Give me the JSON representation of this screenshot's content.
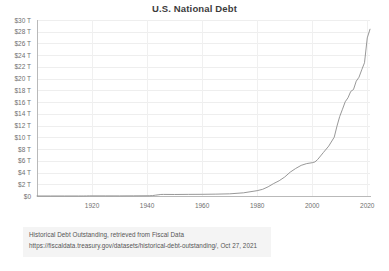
{
  "chart_data": {
    "type": "line",
    "title": "U.S. National Debt",
    "xlabel": "",
    "ylabel": "",
    "xlim": [
      1900,
      2021
    ],
    "ylim": [
      0,
      30
    ],
    "grid": true,
    "legend": "none",
    "y_unit": "trillions of USD",
    "y_tick_labels": [
      "$30 T",
      "$28 T",
      "$26 T",
      "$24 T",
      "$22 T",
      "$20 T",
      "$18 T",
      "$16 T",
      "$14 T",
      "$12 T",
      "$10 T",
      "$8 T",
      "$6 T",
      "$4 T",
      "$2 T",
      "$0"
    ],
    "y_tick_values": [
      30,
      28,
      26,
      24,
      22,
      20,
      18,
      16,
      14,
      12,
      10,
      8,
      6,
      4,
      2,
      0
    ],
    "x_tick_labels": [
      "1920",
      "1940",
      "1960",
      "1980",
      "2000",
      "2020"
    ],
    "x_tick_values": [
      1920,
      1940,
      1960,
      1980,
      2000,
      2020
    ],
    "series": [
      {
        "name": "Total Public Debt Outstanding",
        "color": "#8c8c8c",
        "x": [
          1900,
          1905,
          1910,
          1915,
          1916,
          1917,
          1918,
          1919,
          1920,
          1925,
          1930,
          1935,
          1940,
          1941,
          1942,
          1943,
          1944,
          1945,
          1946,
          1950,
          1955,
          1960,
          1965,
          1970,
          1975,
          1980,
          1982,
          1984,
          1986,
          1988,
          1990,
          1992,
          1994,
          1996,
          1998,
          2000,
          2001,
          2002,
          2004,
          2006,
          2008,
          2009,
          2010,
          2011,
          2012,
          2013,
          2014,
          2015,
          2016,
          2017,
          2018,
          2019,
          2020,
          2021
        ],
        "y": [
          0.00126,
          0.00116,
          0.00113,
          0.00115,
          0.00122,
          0.00298,
          0.0122,
          0.0256,
          0.0242,
          0.0209,
          0.0162,
          0.0286,
          0.043,
          0.049,
          0.0723,
          0.1366,
          0.201,
          0.2587,
          0.269,
          0.257,
          0.274,
          0.286,
          0.317,
          0.37,
          0.541,
          0.908,
          1.142,
          1.573,
          2.125,
          2.602,
          3.233,
          4.065,
          4.693,
          5.225,
          5.526,
          5.674,
          5.807,
          6.228,
          7.379,
          8.507,
          10.025,
          11.91,
          13.562,
          14.79,
          16.066,
          16.738,
          17.824,
          18.151,
          19.573,
          20.245,
          21.516,
          22.719,
          26.945,
          28.428
        ]
      }
    ],
    "annotations": []
  },
  "caption": {
    "line_1": "Historical Debt Outstanding, retrieved from Fiscal Data",
    "line_2": "https://fiscaldata.treasury.gov/datasets/historical-debt-outstanding/, Oct 27, 2021"
  },
  "colors": {
    "background": "#ffffff",
    "line": "#8c8c8c",
    "grid": "#eeeeee",
    "axis": "#b9b9b9",
    "tick_text": "#6f6f6f",
    "title_text": "#3c3c3c",
    "caption_text": "#545454",
    "caption_background": "#f4f4f4"
  }
}
